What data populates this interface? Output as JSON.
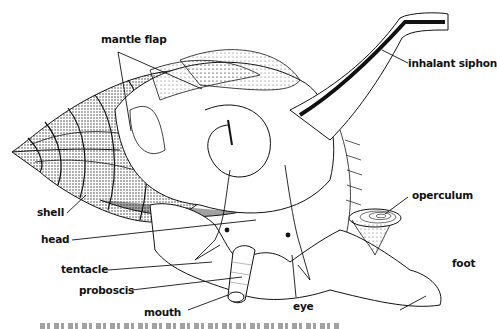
{
  "figure": {
    "labels": {
      "mantle_flap": "mantle flap",
      "inhalant_siphon": "inhalant siphon",
      "shell": "shell",
      "head": "head",
      "operculum": "operculum",
      "tentacle": "tentacle",
      "proboscis": "proboscis",
      "foot": "foot",
      "mouth": "mouth",
      "eye": "eye"
    }
  },
  "colors": {
    "ink": "#111111",
    "background": "#ffffff",
    "stipple": "#555555"
  }
}
